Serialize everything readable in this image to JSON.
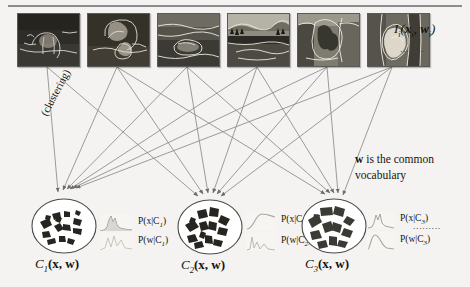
{
  "figure": {
    "type": "diagram"
  },
  "top_row": {
    "image_label": "I",
    "image_label_sub": "i",
    "image_label_args": "(x",
    "image_label_args_sub1": "i",
    "image_label_args_mid": ", w",
    "image_label_args_sub2": "i",
    "image_label_args_end": ")",
    "image_label_plain": "I_i(x_i, w_i)",
    "ellipsis": "........",
    "images": [
      {
        "name": "horse-segmentation",
        "caption": "horse on grass with contours"
      },
      {
        "name": "rocks-bucket-segmentation",
        "caption": "rocks and bucket with contours"
      },
      {
        "name": "boat-shore-segmentation",
        "caption": "boat on shore with contours"
      },
      {
        "name": "lake-mountain-segmentation",
        "caption": "lake and mountain scene"
      },
      {
        "name": "people-trees-segmentation",
        "caption": "people among trees with contours"
      },
      {
        "name": "bird-branch-segmentation",
        "caption": "bird on branch with contours"
      }
    ]
  },
  "annotations": {
    "clustering": "(clustering)",
    "vocabulary_line1_bold": "w",
    "vocabulary_line1_rest": " is the common",
    "vocabulary_line2": "vocabulary",
    "right_ellipsis": "........."
  },
  "clusters": [
    {
      "id": "C1",
      "label_main": "C",
      "label_sub": "1",
      "label_args": "(x, w)",
      "label_plain": "C_1(x, w)",
      "dist_x": "P(x|C",
      "dist_x_sub": "1",
      "dist_x_end": ")",
      "dist_x_plain": "P(x|C_1)",
      "dist_w": "P(w|C",
      "dist_w_sub": "1",
      "dist_w_end": ")",
      "dist_w_plain": "P(w|C_1)"
    },
    {
      "id": "C2",
      "label_main": "C",
      "label_sub": "2",
      "label_args": "(x, w)",
      "label_plain": "C_2(x, w)",
      "dist_x": "P(x|C",
      "dist_x_sub": "2",
      "dist_x_end": ")",
      "dist_x_plain": "P(x|C_2)",
      "dist_w": "P(w|C",
      "dist_w_sub": "2",
      "dist_w_end": ")",
      "dist_w_plain": "P(w|C_2)"
    },
    {
      "id": "C3",
      "label_main": "C",
      "label_sub": "3",
      "label_args": "(x, w)",
      "label_plain": "C_3(x, w)",
      "dist_x": "P(x|C",
      "dist_x_sub": "3",
      "dist_x_end": ")",
      "dist_x_plain": "P(x|C_3)",
      "dist_w": "P(w|C",
      "dist_w_sub": "3",
      "dist_w_end": ")",
      "dist_w_plain": "P(w|C_3)"
    }
  ],
  "colors": {
    "background": "#f4f3f1",
    "line": "#8a8a88",
    "arrow": "#6b6b69",
    "text": "#15130f",
    "patch": "#2a2a28",
    "patch_gray": "#6e6e6c",
    "circle_stroke": "#4a4a48",
    "plot_stroke": "#b9b6b2"
  }
}
